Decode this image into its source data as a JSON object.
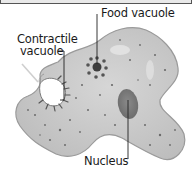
{
  "diagram": {
    "labels": {
      "food_vacuole": "Food vacuole",
      "contractile_vacuole_line1": "Contractile",
      "contractile_vacuole_line2": "vacuole",
      "nucleus": "Nucleus"
    },
    "colors": {
      "cell_fill": "#c9c9c9",
      "cell_edge": "#9a9a9a",
      "nucleus": "#7d7d7d",
      "food_vacuole": "#4a4a4a",
      "leader_line": "#222222",
      "background": "#ffffff"
    }
  }
}
